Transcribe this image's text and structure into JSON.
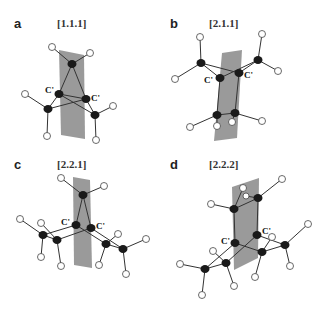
{
  "figure": {
    "panels": [
      {
        "letter": "a",
        "title": "[1.1.1]",
        "bridgehead_label": "C'"
      },
      {
        "letter": "b",
        "title": "[2.1.1]",
        "bridgehead_label": "C'"
      },
      {
        "letter": "c",
        "title": "[2.2.1]",
        "bridgehead_label": "C'"
      },
      {
        "letter": "d",
        "title": "[2.2.2]",
        "bridgehead_label": "C'"
      }
    ],
    "colors": {
      "carbon": "#1a1a1a",
      "hydrogen": "#ffffff",
      "plane": "#8f8f8f"
    }
  }
}
